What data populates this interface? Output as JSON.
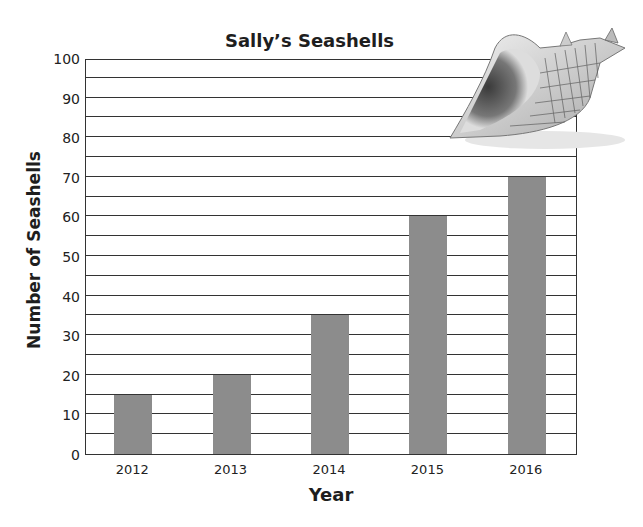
{
  "chart_data": {
    "type": "bar",
    "title": "Sally’s Seashells",
    "xlabel": "Year",
    "ylabel": "Number of Seashells",
    "categories": [
      "2012",
      "2013",
      "2014",
      "2015",
      "2016"
    ],
    "values": [
      15,
      20,
      35,
      60,
      70
    ],
    "ylim": [
      0,
      100
    ],
    "yticks": [
      "0",
      "10",
      "20",
      "30",
      "40",
      "50",
      "60",
      "70",
      "80",
      "90",
      "100"
    ],
    "grid_step": 5,
    "grid": true,
    "legend": null,
    "bar_color": "#8c8c8c",
    "decoration": "seashell-image"
  }
}
